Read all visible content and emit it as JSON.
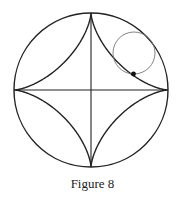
{
  "caption": "Figure 8",
  "diagram": {
    "type": "astroid-construction",
    "outer_circle": {
      "cx": 91,
      "cy": 90,
      "r": 77
    },
    "rolling_circle": {
      "cx": 134,
      "cy": 53,
      "r": 21
    },
    "tracing_point": {
      "x": 133.5,
      "y": 74
    },
    "axes": [
      "horizontal diameter",
      "vertical diameter"
    ],
    "curve": "astroid (four-cusped hypocycloid)",
    "colors": {
      "stroke": "#222222",
      "rolling_circle": "#777777",
      "point": "#111111"
    }
  }
}
